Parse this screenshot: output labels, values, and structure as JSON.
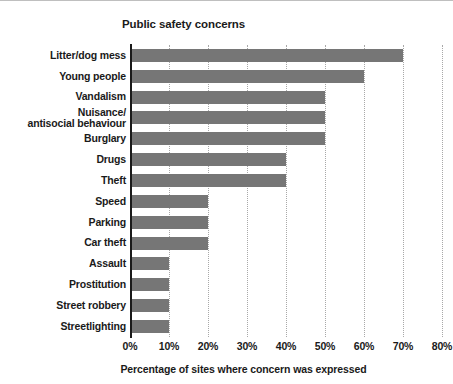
{
  "chart_data": {
    "type": "bar",
    "orientation": "horizontal",
    "title": "Public safety concerns",
    "xlabel": "Percentage of sites where concern was expressed",
    "ylabel": "",
    "xlim": [
      0,
      80
    ],
    "xticks": [
      "0%",
      "10%",
      "20%",
      "30%",
      "40%",
      "50%",
      "60%",
      "70%",
      "80%"
    ],
    "xtick_values": [
      0,
      10,
      20,
      30,
      40,
      50,
      60,
      70,
      80
    ],
    "grid": "vertical-dotted",
    "legend": "none",
    "bar_color": "#767676",
    "axis_color": "#1a1a1a",
    "gridline_color": "#a8a8a8",
    "categories": [
      "Litter/dog mess",
      "Young people",
      "Vandalism",
      "Nuisance/\nantisocial behaviour",
      "Burglary",
      "Drugs",
      "Theft",
      "Speed",
      "Parking",
      "Car theft",
      "Assault",
      "Prostitution",
      "Street robbery",
      "Streetlighting"
    ],
    "values": [
      70,
      60,
      50,
      50,
      50,
      40,
      40,
      20,
      20,
      20,
      10,
      10,
      10,
      10
    ]
  }
}
